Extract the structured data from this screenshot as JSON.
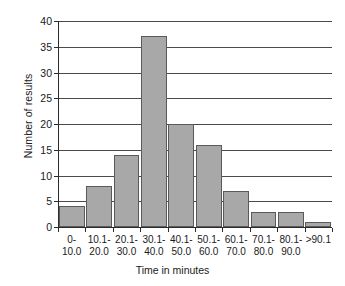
{
  "chart_data": {
    "type": "bar",
    "title": "",
    "subtitle": "",
    "xlabel": "Time in minutes",
    "ylabel": "Number of results",
    "categories": [
      "0-\n10.0",
      "10.1-\n20.0",
      "20.1-\n30.0",
      "30.1-\n40.0",
      "40.1-\n50.0",
      "50.1-\n60.0",
      "60.1-\n70.0",
      "70.1-\n80.0",
      "80.1-\n90.0",
      ">90.1"
    ],
    "category_lines": [
      [
        "0-",
        "10.0"
      ],
      [
        "10.1-",
        "20.0"
      ],
      [
        "20.1-",
        "30.0"
      ],
      [
        "30.1-",
        "40.0"
      ],
      [
        "40.1-",
        "50.0"
      ],
      [
        "50.1-",
        "60.0"
      ],
      [
        "60.1-",
        "70.0"
      ],
      [
        "70.1-",
        "80.0"
      ],
      [
        "80.1-",
        "90.0"
      ],
      [
        ">90.1",
        ""
      ]
    ],
    "values": [
      4,
      8,
      14,
      37,
      20,
      16,
      7,
      3,
      3,
      1
    ],
    "ylim": [
      0,
      40
    ],
    "yticks": [
      0,
      5,
      10,
      15,
      20,
      25,
      30,
      35,
      40
    ],
    "ytick_labels": [
      "0",
      "5",
      "10",
      "15",
      "20",
      "25",
      "30",
      "35",
      "40"
    ],
    "grid": "horizontal",
    "legend": "none",
    "bar_color": "#a8a8a8",
    "bar_edge_color": "#5a5a5a",
    "axis_color": "#2b2b2b",
    "grid_color": "#4a4a4a",
    "background": "#ffffff"
  }
}
